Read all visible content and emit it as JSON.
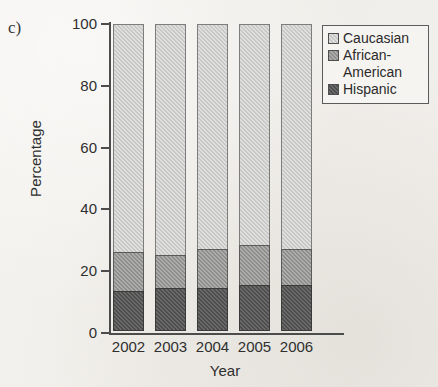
{
  "figure": {
    "panel_label": "c)"
  },
  "legend": {
    "position": "top-right",
    "entries": [
      {
        "label": "Caucasian",
        "color": "#c7c7c5",
        "swatch_name": "legend-swatch-caucasian"
      },
      {
        "label": "African-\nAmerican",
        "color": "#8d8d8b",
        "swatch_name": "legend-swatch-african-american"
      },
      {
        "label": "Hispanic",
        "color": "#4d4d4d",
        "swatch_name": "legend-swatch-hispanic"
      }
    ]
  },
  "axes": {
    "ylabel": "Percentage",
    "xlabel": "Year",
    "y_ticks": [
      0,
      20,
      40,
      60,
      80,
      100
    ],
    "x_ticks": [
      "2002",
      "2003",
      "2004",
      "2005",
      "2006"
    ]
  },
  "chart_data": {
    "type": "bar",
    "subtype": "stacked-percentage",
    "title": "",
    "subtitle": "",
    "xlabel": "Year",
    "ylabel": "Percentage",
    "categories": [
      "2002",
      "2003",
      "2004",
      "2005",
      "2006"
    ],
    "ylim": [
      0,
      100
    ],
    "yticks": [
      0,
      20,
      40,
      60,
      80,
      100
    ],
    "grid": false,
    "legend_position": "top-right",
    "stack_order_bottom_to_top": [
      "Hispanic",
      "African-American",
      "Caucasian"
    ],
    "series": [
      {
        "name": "Hispanic",
        "color": "#4d4d4d",
        "values": [
          13,
          14,
          14,
          15,
          15
        ]
      },
      {
        "name": "African-American",
        "color": "#8d8d8b",
        "values": [
          13,
          11,
          13,
          13,
          12
        ]
      },
      {
        "name": "Caucasian",
        "color": "#c7c7c5",
        "values": [
          74,
          75,
          73,
          72,
          73
        ]
      }
    ],
    "cumulative_tops": {
      "Hispanic": [
        13,
        14,
        14,
        15,
        15
      ],
      "African-American": [
        26,
        25,
        27,
        28,
        27
      ],
      "Caucasian": [
        100,
        100,
        100,
        100,
        100
      ]
    }
  }
}
